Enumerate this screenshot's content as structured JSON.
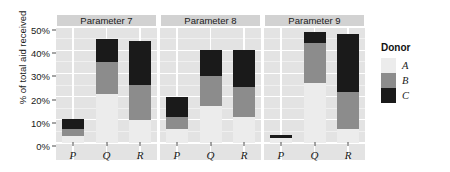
{
  "chart_data": {
    "type": "bar",
    "subtype": "stacked-bar-faceted",
    "title": "",
    "xlabel": "",
    "ylabel": "% of total aid received",
    "ylim": [
      0,
      50
    ],
    "yticks": [
      0,
      10,
      20,
      30,
      40,
      50
    ],
    "ytick_labels": [
      "0%",
      "10%",
      "20%",
      "30%",
      "40%",
      "50%"
    ],
    "grid": true,
    "legend_position": "right",
    "legend_title": "Donor",
    "categories": [
      "P",
      "Q",
      "R"
    ],
    "facets": [
      "Parameter 7",
      "Parameter 8",
      "Parameter 9"
    ],
    "series": [
      {
        "name": "A",
        "color": "#ececec",
        "values_by_facet": {
          "Parameter 7": [
            3,
            21,
            10
          ],
          "Parameter 8": [
            6,
            16,
            11
          ],
          "Parameter 9": [
            2,
            26,
            6
          ]
        }
      },
      {
        "name": "B",
        "color": "#8c8c8c",
        "values_by_facet": {
          "Parameter 7": [
            3,
            14,
            15
          ],
          "Parameter 8": [
            5,
            13,
            13
          ],
          "Parameter 9": [
            0,
            17,
            16
          ]
        }
      },
      {
        "name": "C",
        "color": "#1a1a1a",
        "values_by_facet": {
          "Parameter 7": [
            4.5,
            10,
            19
          ],
          "Parameter 8": [
            9,
            11,
            16
          ],
          "Parameter 9": [
            1.5,
            5,
            25
          ]
        }
      }
    ],
    "bars": [
      {
        "facet": "Parameter 7",
        "category": "P",
        "segments": [
          {
            "donor": "A",
            "from": 0,
            "to": 3
          },
          {
            "donor": "B",
            "from": 3,
            "to": 6
          },
          {
            "donor": "C",
            "from": 6,
            "to": 10.5
          }
        ],
        "total": 10.5
      },
      {
        "facet": "Parameter 7",
        "category": "Q",
        "segments": [
          {
            "donor": "A",
            "from": 0,
            "to": 21
          },
          {
            "donor": "B",
            "from": 21,
            "to": 35
          },
          {
            "donor": "C",
            "from": 35,
            "to": 45
          }
        ],
        "total": 45
      },
      {
        "facet": "Parameter 7",
        "category": "R",
        "segments": [
          {
            "donor": "A",
            "from": 0,
            "to": 10
          },
          {
            "donor": "B",
            "from": 10,
            "to": 25
          },
          {
            "donor": "C",
            "from": 25,
            "to": 44
          }
        ],
        "total": 44
      },
      {
        "facet": "Parameter 8",
        "category": "P",
        "segments": [
          {
            "donor": "A",
            "from": 0,
            "to": 6
          },
          {
            "donor": "B",
            "from": 6,
            "to": 11
          },
          {
            "donor": "C",
            "from": 11,
            "to": 20
          }
        ],
        "total": 20
      },
      {
        "facet": "Parameter 8",
        "category": "Q",
        "segments": [
          {
            "donor": "A",
            "from": 0,
            "to": 16
          },
          {
            "donor": "B",
            "from": 16,
            "to": 29
          },
          {
            "donor": "C",
            "from": 29,
            "to": 40
          }
        ],
        "total": 40
      },
      {
        "facet": "Parameter 8",
        "category": "R",
        "segments": [
          {
            "donor": "A",
            "from": 0,
            "to": 11
          },
          {
            "donor": "B",
            "from": 11,
            "to": 24
          },
          {
            "donor": "C",
            "from": 24,
            "to": 40
          }
        ],
        "total": 40
      },
      {
        "facet": "Parameter 9",
        "category": "P",
        "segments": [
          {
            "donor": "A",
            "from": 0,
            "to": 2
          },
          {
            "donor": "C",
            "from": 2,
            "to": 3.5
          }
        ],
        "total": 3.5
      },
      {
        "facet": "Parameter 9",
        "category": "Q",
        "segments": [
          {
            "donor": "A",
            "from": 0,
            "to": 26
          },
          {
            "donor": "B",
            "from": 26,
            "to": 43
          },
          {
            "donor": "C",
            "from": 43,
            "to": 48
          }
        ],
        "total": 48
      },
      {
        "facet": "Parameter 9",
        "category": "R",
        "segments": [
          {
            "donor": "A",
            "from": 0,
            "to": 6
          },
          {
            "donor": "B",
            "from": 6,
            "to": 22
          },
          {
            "donor": "C",
            "from": 22,
            "to": 47
          }
        ],
        "total": 47
      }
    ]
  },
  "axis": {
    "y_title": "% of total aid received",
    "y_tick_labels": [
      "50%",
      "40%",
      "30%",
      "20%",
      "10%",
      "0%"
    ],
    "x_tick_labels": [
      "P",
      "Q",
      "R"
    ]
  },
  "facet_strips": [
    {
      "label": "Parameter 7"
    },
    {
      "label": "Parameter 8"
    },
    {
      "label": "Parameter 9"
    }
  ],
  "legend": {
    "title": "Donor",
    "entries": [
      {
        "label": "A",
        "color": "#ececec"
      },
      {
        "label": "B",
        "color": "#8c8c8c"
      },
      {
        "label": "C",
        "color": "#1a1a1a"
      }
    ]
  },
  "colors": {
    "panel_background": "#e3e3e3",
    "strip_background": "#d2d2d2",
    "gridline": "#ffffff",
    "donor_a": "#ececec",
    "donor_b": "#8c8c8c",
    "donor_c": "#1a1a1a"
  }
}
